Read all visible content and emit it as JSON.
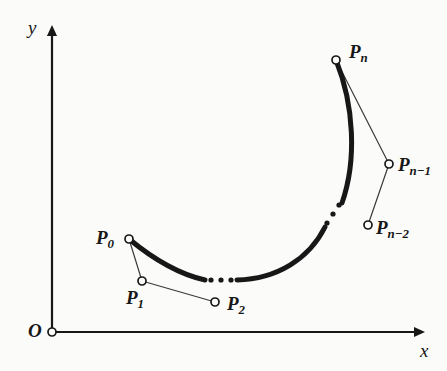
{
  "figure": {
    "kind": "geometry-diagram",
    "background_color": "#fbfbfa",
    "ink_color": "#171717"
  },
  "axes": {
    "origin_label": "O",
    "x_axis_label": "x",
    "y_axis_label": "y",
    "origin_point": {
      "x": 52,
      "y": 332
    },
    "x_axis_end": {
      "x": 425,
      "y": 332
    },
    "y_axis_end": {
      "x": 52,
      "y": 25
    },
    "line_color": "#171717",
    "line_width": 2.2,
    "arrow_size": 11
  },
  "points": [
    {
      "id": "P0",
      "label_base": "P",
      "label_sub": "0",
      "cx": 129,
      "cy": 239,
      "label_x": 96,
      "label_y": 228,
      "label_anchor": "left"
    },
    {
      "id": "P1",
      "label_base": "P",
      "label_sub": "1",
      "cx": 142,
      "cy": 281,
      "label_x": 126,
      "label_y": 288,
      "label_anchor": "left"
    },
    {
      "id": "P2",
      "label_base": "P",
      "label_sub": "2",
      "cx": 215,
      "cy": 302,
      "label_x": 227,
      "label_y": 294,
      "label_anchor": "left"
    },
    {
      "id": "Pn",
      "label_base": "P",
      "label_sub": "n",
      "cx": 336,
      "cy": 60,
      "label_x": 349,
      "label_y": 42,
      "label_anchor": "left"
    },
    {
      "id": "Pn-1",
      "label_base": "P",
      "label_sub": "n−1",
      "cx": 389,
      "cy": 164,
      "label_x": 398,
      "label_y": 155,
      "label_anchor": "left"
    },
    {
      "id": "Pn-2",
      "label_base": "P",
      "label_sub": "n−2",
      "cx": 368,
      "cy": 225,
      "label_x": 376,
      "label_y": 218,
      "label_anchor": "left"
    }
  ],
  "marker": {
    "radius": 4.0,
    "stroke_width": 1.7,
    "fill": "#fbfbfa",
    "stroke": "#171717"
  },
  "control_polygon": {
    "stroke": "#3a3a3a",
    "stroke_width": 1.2,
    "segments": [
      {
        "from": "P0",
        "to": "P1"
      },
      {
        "from": "P1",
        "to": "P2"
      },
      {
        "from": "Pn",
        "to": "Pn-1"
      },
      {
        "from": "Pn-1",
        "to": "Pn-2"
      }
    ]
  },
  "curve": {
    "stroke": "#171717",
    "stroke_width": 5.0,
    "segments": [
      {
        "id": "curve-left",
        "d": "M 129 239 C 152 258 178 274 205 280"
      },
      {
        "id": "curve-bottom",
        "d": "M 237 280 C 277 279 309 259 325 227"
      },
      {
        "id": "curve-right",
        "d": "M 342 203 C 357 160 354 105 336 60"
      }
    ]
  },
  "ellipses": [
    {
      "id": "ellipsis-bottom",
      "orientation": "horizontal",
      "dot_radius": 2.6,
      "dots": [
        {
          "x": 211,
          "y": 280
        },
        {
          "x": 221,
          "y": 280
        },
        {
          "x": 231,
          "y": 280
        }
      ]
    },
    {
      "id": "ellipsis-upper-right",
      "orientation": "diagonal",
      "dot_radius": 2.6,
      "dots": [
        {
          "x": 327,
          "y": 223
        },
        {
          "x": 333,
          "y": 214
        },
        {
          "x": 339,
          "y": 205
        }
      ]
    }
  ]
}
